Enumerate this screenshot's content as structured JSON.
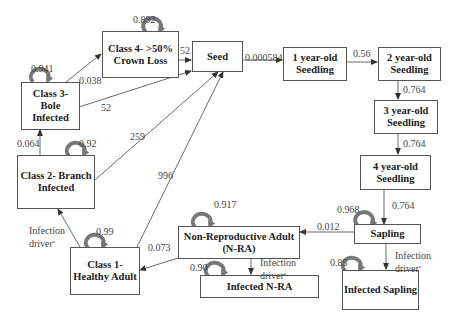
{
  "nodes": {
    "class4": {
      "label": "Class 4- >50% Crown Loss",
      "self_loop": "0.892"
    },
    "seed": {
      "label": "Seed"
    },
    "seedling1": {
      "label": "1 year-old Seedling"
    },
    "seedling2": {
      "label": "2 year-old Seedling"
    },
    "seedling3": {
      "label": "3 year-old Seedling"
    },
    "seedling4": {
      "label": "4 year-old Seedling"
    },
    "sapling": {
      "label": "Sapling",
      "self_loop": "0.968"
    },
    "class3": {
      "label": "Class 3- Bole Infected",
      "self_loop": "0.941"
    },
    "class2": {
      "label": "Class 2- Branch Infected",
      "self_loop": "0.92"
    },
    "class1": {
      "label": "Class 1- Healthy Adult",
      "self_loop": "0.99"
    },
    "nra": {
      "label": "Non-Reproductive Adult (N-RA)",
      "self_loop": "0.917"
    },
    "infected_nra": {
      "label": "Infected N-RA",
      "self_loop": "0.90"
    },
    "infected_sapling": {
      "label": "Infected Sapling",
      "self_loop": "0.85"
    }
  },
  "edges": {
    "class4_seed": "52",
    "class3_class4": "0.038",
    "class3_seed": "52",
    "class2_class3": "0.064",
    "class2_seed": "259",
    "class1_seed": "996",
    "class1_class2": "Infection driver",
    "nra_class1": "0.073",
    "sapling_nra": "0.012",
    "nra_infected": "Infection driver",
    "sapling_infected": "Infection driver",
    "seed_seedling1": "0.000584",
    "seedling1_seedling2": "0.56",
    "seedling2_seedling3": "0.764",
    "seedling3_seedling4": "0.764",
    "seedling4_sapling": "0.764",
    "superscript": "a"
  }
}
